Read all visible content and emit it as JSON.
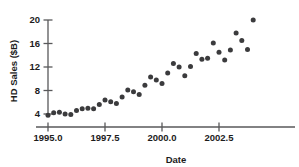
{
  "chart_data": {
    "type": "scatter",
    "title": "",
    "xlabel": "Date",
    "ylabel": "HD Sales ($B)",
    "xlim": [
      1994.6,
      2004.3
    ],
    "ylim": [
      2.6,
      21.0
    ],
    "xticks": [
      1995.0,
      1997.5,
      2000.0,
      2002.5
    ],
    "xtick_labels": [
      "1995.0",
      "1997.5",
      "2000.0",
      "2002.5"
    ],
    "yticks": [
      4,
      8,
      12,
      16,
      20
    ],
    "ytick_labels": [
      "4",
      "8",
      "12",
      "16",
      "20"
    ],
    "grid": false,
    "legend": false,
    "marker_color": "#3b3b3d",
    "axis_color": "#58585a",
    "x": [
      1995.0,
      1995.25,
      1995.5,
      1995.75,
      1996.0,
      1996.25,
      1996.5,
      1996.75,
      1997.0,
      1997.25,
      1997.5,
      1997.75,
      1998.0,
      1998.25,
      1998.5,
      1998.75,
      1999.0,
      1999.25,
      1999.5,
      1999.75,
      2000.0,
      2000.25,
      2000.5,
      2000.75,
      2001.0,
      2001.25,
      2001.5,
      2001.75,
      2002.0,
      2002.25,
      2002.5,
      2002.75,
      2003.0,
      2003.25,
      2003.5,
      2003.75,
      2004.0
    ],
    "y": [
      3.8,
      4.2,
      4.3,
      4.0,
      3.9,
      4.6,
      4.9,
      5.0,
      4.9,
      5.6,
      6.4,
      6.1,
      5.8,
      6.9,
      8.1,
      7.8,
      7.3,
      8.9,
      10.3,
      9.8,
      9.2,
      11.0,
      12.6,
      12.0,
      10.5,
      12.1,
      14.3,
      13.3,
      13.5,
      16.1,
      14.5,
      13.2,
      14.9,
      17.8,
      16.5,
      15.0,
      20.0
    ],
    "series_name": "HD Sales"
  },
  "axes": {
    "y_axis_title": "HD Sales ($B)",
    "x_axis_title": "Date"
  }
}
